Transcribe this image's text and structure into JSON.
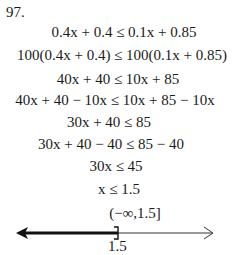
{
  "problem": {
    "number": "97.",
    "steps": [
      "0.4x + 0.4 ≤ 0.1x + 0.85",
      "100(0.4x + 0.4) ≤ 100(0.1x + 0.85)",
      "40x + 40 ≤ 10x + 85",
      "40x + 40 − 10x ≤ 10x + 85 − 10x",
      "30x + 40 ≤ 85",
      "30x + 40 − 40 ≤ 85 − 40",
      "30x ≤ 45",
      "x ≤ 1.5"
    ],
    "interval": "(−∞,1.5]"
  },
  "number_line": {
    "endpoint_label": "1.5",
    "endpoint_bracket": "]",
    "shaded_direction": "left"
  }
}
